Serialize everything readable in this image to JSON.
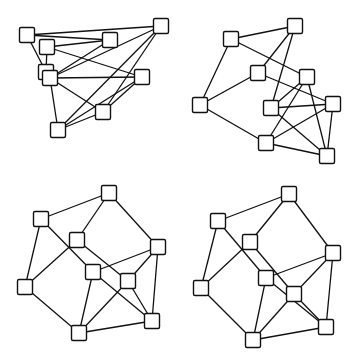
{
  "canvas": {
    "width": 357,
    "height": 363,
    "background": "#ffffff"
  },
  "style": {
    "edge_color": "#111111",
    "node_fill": "#ffffff",
    "node_stroke": "#111111",
    "node_size": 15
  },
  "graphs": [
    {
      "id": "top-left",
      "nodes": {
        "A": [
          27,
          35
        ],
        "B": [
          47,
          47
        ],
        "C": [
          110,
          40
        ],
        "D": [
          161,
          26
        ],
        "E": [
          46,
          72
        ],
        "F": [
          50,
          78
        ],
        "G": [
          142,
          77
        ],
        "H": [
          103,
          112
        ],
        "I": [
          58,
          130
        ]
      },
      "edges": [
        [
          "A",
          "D"
        ],
        [
          "A",
          "C"
        ],
        [
          "A",
          "E"
        ],
        [
          "B",
          "C"
        ],
        [
          "B",
          "E"
        ],
        [
          "B",
          "G"
        ],
        [
          "F",
          "C"
        ],
        [
          "F",
          "D"
        ],
        [
          "F",
          "G"
        ],
        [
          "F",
          "H"
        ],
        [
          "F",
          "I"
        ],
        [
          "I",
          "D"
        ],
        [
          "I",
          "G"
        ],
        [
          "I",
          "H"
        ],
        [
          "H",
          "G"
        ],
        [
          "H",
          "D"
        ]
      ]
    },
    {
      "id": "top-right",
      "nodes": {
        "A": [
          231,
          39
        ],
        "B": [
          295,
          26
        ],
        "C": [
          258,
          73
        ],
        "D": [
          307,
          77
        ],
        "E": [
          200,
          105
        ],
        "F": [
          271,
          108
        ],
        "G": [
          333,
          104
        ],
        "H": [
          266,
          143
        ],
        "I": [
          327,
          156
        ]
      },
      "edges": [
        [
          "A",
          "B"
        ],
        [
          "A",
          "E"
        ],
        [
          "A",
          "D"
        ],
        [
          "B",
          "C"
        ],
        [
          "B",
          "F"
        ],
        [
          "C",
          "E"
        ],
        [
          "C",
          "G"
        ],
        [
          "E",
          "H"
        ],
        [
          "D",
          "F"
        ],
        [
          "D",
          "H"
        ],
        [
          "D",
          "I"
        ],
        [
          "F",
          "G"
        ],
        [
          "F",
          "I"
        ],
        [
          "G",
          "H"
        ],
        [
          "G",
          "I"
        ],
        [
          "H",
          "I"
        ]
      ]
    },
    {
      "id": "bottom-left",
      "nodes": {
        "A": [
          109,
          193
        ],
        "B": [
          41,
          219
        ],
        "C": [
          77,
          240
        ],
        "D": [
          158,
          247
        ],
        "E": [
          25,
          287
        ],
        "F": [
          93,
          272
        ],
        "G": [
          128,
          281
        ],
        "H": [
          152,
          321
        ],
        "I": [
          79,
          333
        ]
      },
      "edges": [
        [
          "A",
          "B"
        ],
        [
          "A",
          "C"
        ],
        [
          "A",
          "D"
        ],
        [
          "B",
          "E"
        ],
        [
          "B",
          "F"
        ],
        [
          "C",
          "E"
        ],
        [
          "C",
          "G"
        ],
        [
          "D",
          "F"
        ],
        [
          "D",
          "G"
        ],
        [
          "D",
          "H"
        ],
        [
          "F",
          "H"
        ],
        [
          "F",
          "I"
        ],
        [
          "G",
          "H"
        ],
        [
          "G",
          "I"
        ],
        [
          "H",
          "I"
        ],
        [
          "E",
          "I"
        ]
      ]
    },
    {
      "id": "bottom-right",
      "nodes": {
        "A": [
          289,
          194
        ],
        "B": [
          218,
          221
        ],
        "C": [
          250,
          242
        ],
        "D": [
          333,
          253
        ],
        "E": [
          201,
          288
        ],
        "F": [
          266,
          278
        ],
        "G": [
          294,
          294
        ],
        "H": [
          326,
          327
        ],
        "I": [
          253,
          340
        ]
      },
      "edges": [
        [
          "A",
          "B"
        ],
        [
          "A",
          "C"
        ],
        [
          "A",
          "D"
        ],
        [
          "B",
          "E"
        ],
        [
          "B",
          "F"
        ],
        [
          "C",
          "E"
        ],
        [
          "C",
          "G"
        ],
        [
          "D",
          "F"
        ],
        [
          "D",
          "G"
        ],
        [
          "D",
          "H"
        ],
        [
          "F",
          "H"
        ],
        [
          "F",
          "I"
        ],
        [
          "G",
          "H"
        ],
        [
          "G",
          "I"
        ],
        [
          "H",
          "I"
        ],
        [
          "E",
          "I"
        ]
      ]
    }
  ]
}
